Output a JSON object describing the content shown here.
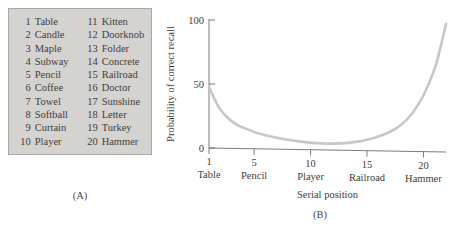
{
  "figure": {
    "panel_a_caption": "(A)",
    "panel_b_caption": "(B)"
  },
  "word_list": {
    "columns": [
      [
        {
          "num": "1",
          "word": "Table"
        },
        {
          "num": "2",
          "word": "Candle"
        },
        {
          "num": "3",
          "word": "Maple"
        },
        {
          "num": "4",
          "word": "Subway"
        },
        {
          "num": "5",
          "word": "Pencil"
        },
        {
          "num": "6",
          "word": "Coffee"
        },
        {
          "num": "7",
          "word": "Towel"
        },
        {
          "num": "8",
          "word": "Softball"
        },
        {
          "num": "9",
          "word": "Curtain"
        },
        {
          "num": "10",
          "word": "Player"
        }
      ],
      [
        {
          "num": "11",
          "word": "Kitten"
        },
        {
          "num": "12",
          "word": "Doorknob"
        },
        {
          "num": "13",
          "word": "Folder"
        },
        {
          "num": "14",
          "word": "Concrete"
        },
        {
          "num": "15",
          "word": "Railroad"
        },
        {
          "num": "16",
          "word": "Doctor"
        },
        {
          "num": "17",
          "word": "Sunshine"
        },
        {
          "num": "18",
          "word": "Letter"
        },
        {
          "num": "19",
          "word": "Turkey"
        },
        {
          "num": "20",
          "word": "Hammer"
        }
      ]
    ]
  },
  "chart_data": {
    "type": "line",
    "title": "",
    "xlabel": "Serial position",
    "ylabel": "Probability of correct recall",
    "xlim": [
      1,
      22
    ],
    "ylim": [
      0,
      100
    ],
    "grid": false,
    "legend": null,
    "ytick_values": [
      0,
      50,
      100
    ],
    "ytick_labels": [
      "0",
      "50",
      "100"
    ],
    "xtick_values": [
      1,
      5,
      10,
      15,
      20
    ],
    "xtick_labels": [
      "1",
      "5",
      "10",
      "15",
      "20"
    ],
    "xtick_sublabels": [
      "Table",
      "Pencil",
      "Player",
      "Railroad",
      "Hammer"
    ],
    "series": [
      {
        "name": "Probability of correct recall",
        "color": "#c9c7c6",
        "x": [
          1,
          1.5,
          2,
          2.5,
          3,
          3.5,
          4,
          5,
          6,
          7,
          8,
          9,
          10,
          11,
          12,
          13,
          14,
          15,
          16,
          17,
          18,
          19,
          20,
          21,
          21.6,
          22
        ],
        "values": [
          48,
          38,
          30,
          25,
          21,
          18,
          16,
          12.5,
          10,
          8,
          6.5,
          5.2,
          4.2,
          3.6,
          3.4,
          3.8,
          4.8,
          6.5,
          9,
          12.5,
          18,
          27,
          41,
          62,
          82,
          97
        ]
      }
    ]
  }
}
